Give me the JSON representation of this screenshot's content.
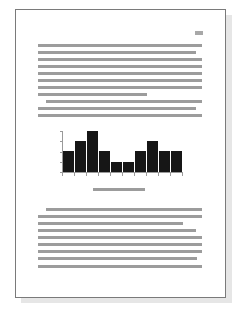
{
  "document": {
    "page_number_mark": {
      "x": 195,
      "y": 31,
      "width": 8
    },
    "paragraph_1": {
      "lines": [
        {
          "x": 38,
          "y": 44,
          "end": 202
        },
        {
          "x": 38,
          "y": 51,
          "end": 196
        },
        {
          "x": 38,
          "y": 58,
          "end": 202
        },
        {
          "x": 38,
          "y": 65,
          "end": 202
        },
        {
          "x": 38,
          "y": 72,
          "end": 202
        },
        {
          "x": 38,
          "y": 79,
          "end": 202
        },
        {
          "x": 38,
          "y": 86,
          "end": 202
        },
        {
          "x": 38,
          "y": 93,
          "end": 147
        }
      ]
    },
    "paragraph_2": {
      "lines": [
        {
          "x": 46,
          "y": 100,
          "end": 202
        },
        {
          "x": 38,
          "y": 107,
          "end": 196
        },
        {
          "x": 38,
          "y": 114,
          "end": 202
        }
      ]
    },
    "figure_caption": {
      "x": 93,
      "y": 188,
      "end": 145
    },
    "paragraph_3": {
      "lines": [
        {
          "x": 46,
          "y": 208,
          "end": 202
        },
        {
          "x": 38,
          "y": 215,
          "end": 202
        },
        {
          "x": 38,
          "y": 222,
          "end": 183
        },
        {
          "x": 38,
          "y": 229,
          "end": 196
        },
        {
          "x": 38,
          "y": 236,
          "end": 202
        },
        {
          "x": 38,
          "y": 243,
          "end": 202
        },
        {
          "x": 38,
          "y": 250,
          "end": 202
        },
        {
          "x": 38,
          "y": 257,
          "end": 197
        },
        {
          "x": 38,
          "y": 265,
          "end": 202
        }
      ]
    },
    "colors": {
      "text_line": "#9c9c9c",
      "bar": "#161616",
      "page_border": "#7a7a7a",
      "shadow": "#e6e6e6"
    }
  },
  "chart_data": {
    "type": "bar",
    "title": "",
    "xlabel": "",
    "ylabel": "",
    "categories": [
      "1",
      "2",
      "3",
      "4",
      "5",
      "6",
      "7",
      "8",
      "9",
      "10"
    ],
    "values": [
      2,
      3,
      4,
      2,
      1,
      1,
      2,
      3,
      2,
      2
    ],
    "ylim": [
      0,
      4
    ],
    "yticks": [
      0,
      1,
      2,
      3,
      4
    ],
    "grid": false,
    "legend": null,
    "tick_labels_visible": false
  }
}
